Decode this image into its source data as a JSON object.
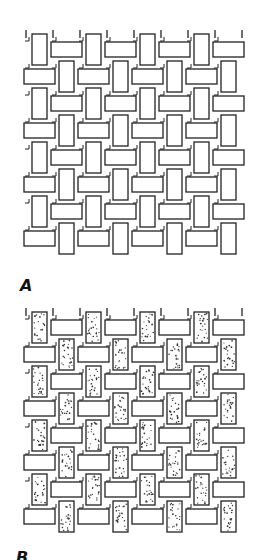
{
  "figure": {
    "panels": [
      {
        "id": "A",
        "label": "A",
        "stippled": false
      },
      {
        "id": "B",
        "label": "B",
        "stippled": true
      }
    ],
    "weave": {
      "type": "basket-weave / plain weave",
      "columns": 8,
      "rows": 8,
      "cell_pitch_px": 27,
      "stroke_color": "#222222",
      "stipple_color": "#333333"
    }
  }
}
